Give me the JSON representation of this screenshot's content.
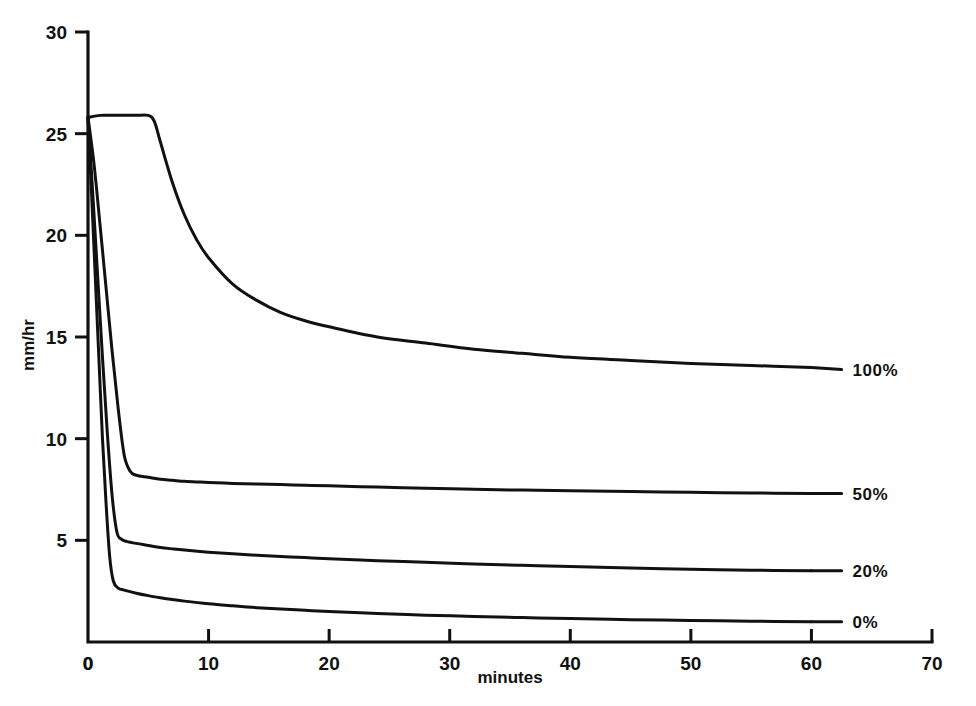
{
  "figure": {
    "clipped_top_title": "",
    "background_color": "#ffffff",
    "line_color": "#111111"
  },
  "axes": {
    "x_title": "minutes",
    "y_title": "mm/hr",
    "x_ticks": [
      "0",
      "10",
      "20",
      "30",
      "40",
      "50",
      "60",
      "70"
    ],
    "y_ticks": [
      "0",
      "5",
      "10",
      "15",
      "20",
      "25",
      "30"
    ]
  },
  "series_labels": {
    "s100": "100%",
    "s50": "50%",
    "s20": "20%",
    "s0": "0%"
  },
  "chart_data": {
    "type": "line",
    "title": "",
    "xlabel": "minutes",
    "ylabel": "mm/hr",
    "xlim": [
      0,
      70
    ],
    "ylim": [
      0,
      30
    ],
    "xticks": [
      0,
      10,
      20,
      30,
      40,
      50,
      60,
      70
    ],
    "yticks": [
      0,
      5,
      10,
      15,
      20,
      25,
      30
    ],
    "grid": false,
    "legend": "inline-right-end-labels",
    "line_color": "#111111",
    "series": [
      {
        "name": "100%",
        "label_position": {
          "x": 62.5,
          "y": 13.4
        },
        "x": [
          0,
          1,
          2,
          3,
          4,
          5,
          5.5,
          6,
          7,
          8,
          9,
          10,
          12,
          14,
          16,
          18,
          20,
          24,
          28,
          32,
          36,
          40,
          45,
          50,
          55,
          60
        ],
        "y": [
          25.8,
          25.9,
          25.9,
          25.9,
          25.9,
          25.9,
          25.6,
          24.6,
          22.6,
          21.0,
          19.8,
          18.9,
          17.6,
          16.8,
          16.2,
          15.8,
          15.5,
          15.0,
          14.7,
          14.4,
          14.2,
          14.0,
          13.85,
          13.7,
          13.6,
          13.5
        ]
      },
      {
        "name": "50%",
        "label_position": {
          "x": 62.5,
          "y": 7.3
        },
        "x": [
          0,
          0.5,
          1,
          1.5,
          2,
          2.5,
          3,
          3.5,
          4,
          5,
          6,
          7,
          8,
          9,
          10,
          12,
          14,
          16,
          18,
          20,
          24,
          28,
          32,
          36,
          40,
          45,
          50,
          55,
          60
        ],
        "y": [
          25.8,
          23.5,
          20.5,
          17.4,
          14.3,
          11.5,
          9.2,
          8.4,
          8.2,
          8.1,
          8.0,
          7.95,
          7.9,
          7.87,
          7.85,
          7.8,
          7.77,
          7.74,
          7.71,
          7.68,
          7.62,
          7.56,
          7.51,
          7.47,
          7.44,
          7.4,
          7.36,
          7.33,
          7.3
        ]
      },
      {
        "name": "20%",
        "label_position": {
          "x": 62.5,
          "y": 3.5
        },
        "x": [
          0,
          0.4,
          0.8,
          1.2,
          1.6,
          2,
          2.4,
          2.8,
          3.2,
          4,
          5,
          6,
          7,
          8,
          10,
          12,
          14,
          16,
          18,
          20,
          24,
          28,
          32,
          36,
          40,
          45,
          50,
          55,
          60
        ],
        "y": [
          25.8,
          22.0,
          18.0,
          14.0,
          10.3,
          7.2,
          5.4,
          5.05,
          4.95,
          4.85,
          4.75,
          4.65,
          4.58,
          4.52,
          4.42,
          4.34,
          4.27,
          4.21,
          4.15,
          4.1,
          4.0,
          3.92,
          3.84,
          3.77,
          3.71,
          3.64,
          3.58,
          3.53,
          3.5
        ]
      },
      {
        "name": "0%",
        "label_position": {
          "x": 62.5,
          "y": 1.0
        },
        "x": [
          0,
          0.3,
          0.6,
          0.9,
          1.2,
          1.5,
          1.8,
          2.1,
          2.5,
          3,
          4,
          5,
          6,
          7,
          8,
          10,
          12,
          14,
          16,
          18,
          20,
          24,
          28,
          32,
          36,
          40,
          45,
          50,
          55,
          60
        ],
        "y": [
          25.8,
          22.0,
          18.0,
          14.0,
          10.0,
          6.8,
          4.2,
          3.0,
          2.65,
          2.55,
          2.4,
          2.28,
          2.18,
          2.09,
          2.01,
          1.88,
          1.78,
          1.69,
          1.62,
          1.56,
          1.5,
          1.4,
          1.32,
          1.26,
          1.2,
          1.15,
          1.1,
          1.06,
          1.02,
          1.0
        ]
      }
    ]
  }
}
